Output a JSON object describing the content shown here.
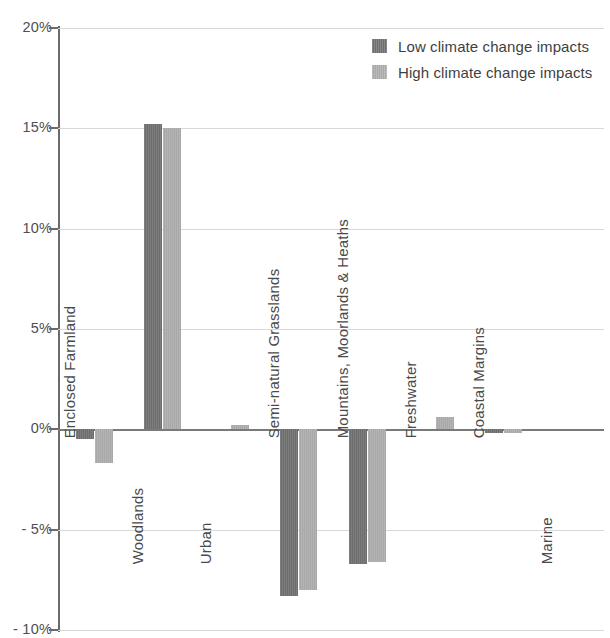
{
  "chart_data": {
    "type": "bar",
    "title": "",
    "subtitle": "",
    "xlabel": "",
    "ylabel": "",
    "ylim": [
      -10,
      20
    ],
    "y_tick_labels": [
      "20%",
      "15%",
      "10%",
      "5%",
      "0%",
      "- 5%",
      "- 10%"
    ],
    "y_ticks": [
      20,
      15,
      10,
      5,
      0,
      -5,
      -10
    ],
    "grid": true,
    "legend_position": "top-right",
    "value_unit": "%",
    "categories": [
      "Enclosed Farmland",
      "Woodlands",
      "Urban",
      "Semi-natural Grasslands",
      "Mountains, Moorlands & Heaths",
      "Freshwater",
      "Coastal Margins",
      "Marine"
    ],
    "series": [
      {
        "name": "Low climate change impacts",
        "color": "#6e6e6e",
        "values": [
          -0.5,
          15.2,
          0.0,
          -8.3,
          -6.7,
          0.0,
          -0.2,
          0.0
        ]
      },
      {
        "name": "High climate change impacts",
        "color": "#a8a8a8",
        "values": [
          -1.7,
          15.0,
          0.2,
          -8.0,
          -6.6,
          0.6,
          -0.2,
          0.0
        ]
      }
    ],
    "category_label_placement": [
      "above-axis",
      "below-axis",
      "below-axis",
      "above-axis",
      "above-axis",
      "above-axis",
      "above-axis",
      "below-axis"
    ]
  },
  "legend": {
    "items": [
      {
        "label": "Low climate change impacts",
        "swatch": "low"
      },
      {
        "label": "High climate change impacts",
        "swatch": "high"
      }
    ]
  },
  "colors": {
    "series_low": "#6e6e6e",
    "series_high": "#a8a8a8",
    "gridline": "#d8d8d8",
    "axis": "#6a6a6a",
    "text": "#4a4a4a",
    "background": "#ffffff"
  }
}
